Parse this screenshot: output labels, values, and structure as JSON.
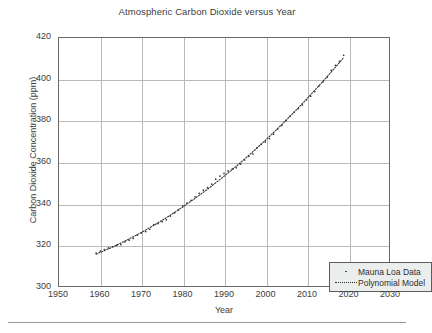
{
  "chart_data": {
    "type": "scatter",
    "title": "Atmospheric Carbon Dioxide versus Year",
    "xlabel": "Year",
    "ylabel": "Carbon Dioxide Concentration (ppm)",
    "xlim": [
      1950,
      2030
    ],
    "ylim": [
      300,
      420
    ],
    "xticks": [
      1950,
      1960,
      1970,
      1980,
      1990,
      2000,
      2010,
      2020,
      2030
    ],
    "yticks": [
      300,
      320,
      340,
      360,
      380,
      400,
      420
    ],
    "grid": true,
    "legend_position": "lower right",
    "series": [
      {
        "name": "Mauna Loa Data",
        "marker": "dot",
        "color": "#333333",
        "x": [
          1959,
          1960,
          1961,
          1962,
          1963,
          1964,
          1965,
          1966,
          1967,
          1968,
          1969,
          1970,
          1971,
          1972,
          1973,
          1974,
          1975,
          1976,
          1977,
          1978,
          1979,
          1980,
          1981,
          1982,
          1983,
          1984,
          1985,
          1986,
          1987,
          1988,
          1989,
          1990,
          1991,
          1992,
          1993,
          1994,
          1995,
          1996,
          1997,
          1998,
          1999,
          2000,
          2001,
          2002,
          2003,
          2004,
          2005,
          2006,
          2007,
          2008,
          2009,
          2010,
          2011,
          2012,
          2013,
          2014,
          2015,
          2016,
          2017,
          2018,
          2019
        ],
        "values": [
          315.98,
          316.91,
          317.64,
          318.45,
          318.99,
          319.62,
          320.04,
          321.37,
          322.18,
          323.05,
          324.62,
          325.68,
          326.32,
          327.46,
          329.68,
          330.19,
          331.12,
          332.03,
          333.84,
          335.41,
          336.84,
          338.76,
          340.12,
          341.48,
          343.15,
          344.85,
          346.35,
          347.61,
          349.31,
          351.69,
          353.2,
          354.45,
          355.7,
          356.54,
          357.21,
          358.96,
          360.97,
          362.74,
          363.88,
          366.84,
          368.54,
          369.71,
          371.32,
          373.45,
          375.98,
          377.7,
          379.98,
          382.09,
          384.02,
          385.83,
          387.64,
          390.1,
          391.85,
          394.06,
          396.74,
          398.81,
          401.01,
          404.41,
          406.76,
          408.72,
          411.66
        ]
      },
      {
        "name": "Polynomial Model",
        "marker": "dotted-line",
        "color": "#333333",
        "x": [
          1959,
          1963,
          1967,
          1971,
          1975,
          1979,
          1983,
          1987,
          1991,
          1995,
          1999,
          2003,
          2007,
          2011,
          2015,
          2019
        ],
        "values": [
          315.7,
          318.3,
          321.3,
          324.7,
          328.4,
          332.5,
          336.9,
          341.7,
          346.8,
          352.3,
          358.1,
          364.3,
          370.8,
          377.7,
          384.9,
          392.5
        ]
      }
    ]
  },
  "legend": {
    "items": [
      {
        "label": "Mauna Loa Data",
        "key": "dot-marker"
      },
      {
        "label": "Polynomial Model",
        "key": "dotted-line-marker"
      }
    ]
  }
}
